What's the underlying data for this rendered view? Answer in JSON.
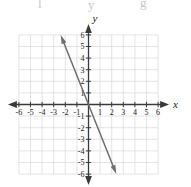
{
  "figure": {
    "kind": "coordinate-plane-line-graph",
    "background_color": "#ffffff",
    "width": 191,
    "height": 187
  },
  "axes": {
    "x_axis_label": "x",
    "y_axis_label": "y",
    "x_tick_labels": [
      "-6",
      "-5",
      "-4",
      "-3",
      "-2",
      "-1",
      "1",
      "2",
      "3",
      "4",
      "5",
      "6"
    ],
    "y_tick_labels": [
      "6",
      "5",
      "4",
      "3",
      "2",
      "1",
      "-1",
      "-2",
      "-3",
      "-4",
      "-5",
      "-6"
    ],
    "axis_color": "#3a3a3a",
    "grid_color": "#d8d8d8",
    "tick_color": "#3a3a3a"
  },
  "top_artifacts": [
    {
      "glyph": "l",
      "x": 38,
      "y": -3
    },
    {
      "glyph": "y",
      "x": 88,
      "y": -2
    },
    {
      "glyph": "g",
      "x": 140,
      "y": -4
    }
  ],
  "chart_data": {
    "type": "line",
    "title": "",
    "xlabel": "x",
    "ylabel": "y",
    "xlim": [
      -6,
      6
    ],
    "ylim": [
      -6,
      6
    ],
    "grid": true,
    "legend": "none",
    "x_ticks": [
      -6,
      -5,
      -4,
      -3,
      -2,
      -1,
      1,
      2,
      3,
      4,
      5,
      6
    ],
    "y_ticks": [
      6,
      5,
      4,
      3,
      2,
      1,
      -1,
      -2,
      -3,
      -4,
      -5,
      -6
    ],
    "series": [
      {
        "name": "line",
        "equation": "y = -2.5x",
        "slope": -2.5,
        "y_intercept": 0,
        "x_intercept": 0,
        "color": "#6e6e6e",
        "arrows": "both",
        "endpoints": [
          {
            "x": -2.4,
            "y": 6
          },
          {
            "x": 2.4,
            "y": -6
          }
        ],
        "points": [
          {
            "x": -2,
            "y": 5
          },
          {
            "x": -1,
            "y": 2.5
          },
          {
            "x": 0,
            "y": 0
          },
          {
            "x": 1,
            "y": -2.5
          },
          {
            "x": 2,
            "y": -5
          }
        ]
      }
    ]
  }
}
